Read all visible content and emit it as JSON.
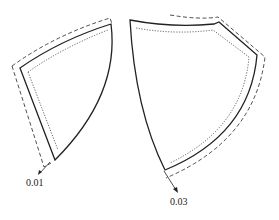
{
  "diagram": {
    "type": "pattern-piece-offset",
    "line_styles": {
      "solid": "pattern outline",
      "dashed": "outer offset",
      "dotted": "inner offset"
    },
    "colors": {
      "line": "#222222",
      "background": "#ffffff"
    },
    "pieces": [
      {
        "name": "left-piece",
        "annotation": "0.01"
      },
      {
        "name": "right-piece",
        "annotation": "0.03"
      }
    ]
  }
}
